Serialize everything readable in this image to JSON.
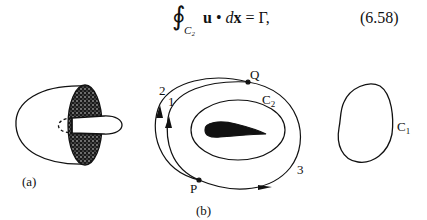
{
  "equation": {
    "integral_symbol": "∮",
    "contour_subscript": "C₂",
    "u": "u",
    "dot": " • ",
    "d": "d",
    "x": "x",
    "rhs": " = Γ,",
    "number": "(6.58)"
  },
  "figure_a": {
    "label": "(a)"
  },
  "figure_b": {
    "label": "(b)",
    "point_P": "P",
    "point_Q": "Q",
    "path_1": "1",
    "path_2": "2",
    "path_3": "3",
    "contour_C2_main": "C",
    "contour_C2_sub": "2"
  },
  "figure_c": {
    "contour_C1_main": "C",
    "contour_C1_sub": "1"
  }
}
